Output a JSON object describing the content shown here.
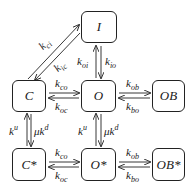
{
  "diagram": {
    "type": "state-transition",
    "states": [
      {
        "id": "I",
        "label": "I"
      },
      {
        "id": "C",
        "label": "C"
      },
      {
        "id": "O",
        "label": "O"
      },
      {
        "id": "OB",
        "label": "OB"
      },
      {
        "id": "Cs",
        "label": "C*"
      },
      {
        "id": "Os",
        "label": "O*"
      },
      {
        "id": "OBs",
        "label": "OB*"
      }
    ],
    "rates": {
      "kci": {
        "base": "k",
        "sub": "ci"
      },
      "kic": {
        "base": "k",
        "sub": "ic"
      },
      "koi": {
        "base": "k",
        "sub": "oi"
      },
      "kio": {
        "base": "k",
        "sub": "io"
      },
      "kco_top": {
        "base": "k",
        "sub": "co"
      },
      "koc_top": {
        "base": "k",
        "sub": "oc"
      },
      "kob_top": {
        "base": "k",
        "sub": "ob"
      },
      "kbo_top": {
        "base": "k",
        "sub": "bo"
      },
      "ku_left": {
        "base": "k",
        "sup": "u"
      },
      "mukd_left": {
        "base": "μk",
        "sup": "d"
      },
      "ku_mid": {
        "base": "k",
        "sup": "u"
      },
      "mukd_mid": {
        "base": "μk",
        "sup": "d"
      },
      "kco_bot": {
        "base": "k",
        "sub": "co"
      },
      "koc_bot": {
        "base": "k",
        "sub": "oc"
      },
      "kob_bot": {
        "base": "k",
        "sub": "ob"
      },
      "kbo_bot": {
        "base": "k",
        "sub": "bo"
      }
    }
  }
}
